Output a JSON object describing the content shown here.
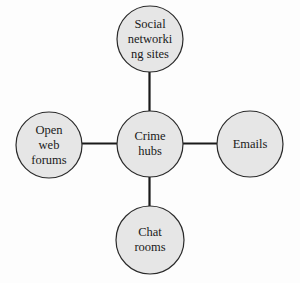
{
  "diagram": {
    "type": "hub-and-spoke",
    "colors": {
      "node_fill": "#e6e6e6",
      "node_stroke": "#2a2a2a",
      "edge": "#1a1a1a",
      "text": "#1a1a1a"
    },
    "hub": {
      "id": "crime-hubs",
      "label": "Crime\nhubs",
      "cx": 150,
      "cy": 144,
      "r": 33
    },
    "nodes": [
      {
        "id": "social-networking-sites",
        "label": "Social\nnetworki\nng sites",
        "cx": 150,
        "cy": 39,
        "r": 33
      },
      {
        "id": "open-web-forums",
        "label": "Open\nweb\nforums",
        "cx": 49,
        "cy": 145,
        "r": 33
      },
      {
        "id": "emails",
        "label": "Emails",
        "cx": 250,
        "cy": 144,
        "r": 33
      },
      {
        "id": "chat-rooms",
        "label": "Chat\nrooms",
        "cx": 150,
        "cy": 240,
        "r": 34
      }
    ],
    "edges": [
      {
        "from": "crime-hubs",
        "to": "social-networking-sites"
      },
      {
        "from": "crime-hubs",
        "to": "open-web-forums"
      },
      {
        "from": "crime-hubs",
        "to": "emails"
      },
      {
        "from": "crime-hubs",
        "to": "chat-rooms"
      }
    ]
  }
}
